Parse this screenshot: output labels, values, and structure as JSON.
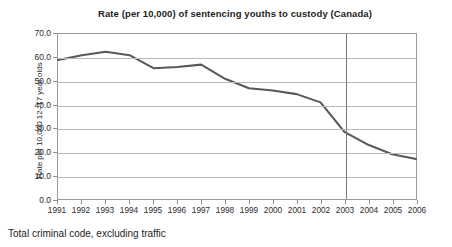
{
  "chart_data": {
    "type": "line",
    "title": "Rate (per 10,000) of sentencing youths to custody (Canada)",
    "xlabel": "",
    "ylabel": "Rate per 10,000 12–17 year olds",
    "footnote": "Total criminal code, excluding traffic",
    "categories": [
      "1991",
      "1992",
      "1993",
      "1994",
      "1995",
      "1996",
      "1997",
      "1998",
      "1999",
      "2000",
      "2001",
      "2002",
      "2003",
      "2004",
      "2005",
      "2006"
    ],
    "values": [
      59.0,
      61.0,
      62.5,
      61.0,
      55.5,
      56.0,
      57.0,
      51.0,
      47.0,
      46.0,
      44.5,
      41.0,
      28.5,
      23.0,
      19.0,
      17.0
    ],
    "series": [
      {
        "name": "Total criminal code, excluding traffic",
        "color": "#595959",
        "values": [
          59.0,
          61.0,
          62.5,
          61.0,
          55.5,
          56.0,
          57.0,
          51.0,
          47.0,
          46.0,
          44.5,
          41.0,
          28.5,
          23.0,
          19.0,
          17.0
        ]
      }
    ],
    "ylim": [
      0.0,
      70.0
    ],
    "ytick_labels": [
      "70.0",
      "60.0",
      "50.0",
      "40.0",
      "30.0",
      "20.0",
      "10.0",
      "0.0"
    ],
    "ytick_values": [
      70.0,
      60.0,
      50.0,
      40.0,
      30.0,
      20.0,
      10.0,
      0.0
    ],
    "grid": true,
    "legend": false,
    "legend_position": "none",
    "annotations": [
      {
        "type": "vertical-reference-line",
        "x_category": "2003",
        "color": "#7a7a7a"
      }
    ],
    "line_color": "#595959",
    "grid_color": "#b9b9b9",
    "frame_color": "#9a9a9a"
  }
}
